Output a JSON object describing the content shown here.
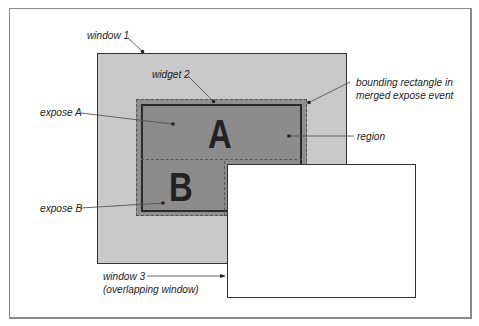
{
  "diagram": {
    "type": "expose-event-region-diagram",
    "shapes": {
      "window1": {
        "label": "window 1",
        "fill": "#c9c9c9"
      },
      "widget2": {
        "label": "widget 2",
        "fill": "#8c8c8c"
      },
      "bounding_rectangle": {
        "label": "bounding rectangle in merged expose event",
        "style": "dashed"
      },
      "window3": {
        "label": "window 3 (overlapping window)",
        "fill": "#ffffff"
      }
    },
    "big_letters": {
      "a": "A",
      "b": "B"
    },
    "labels": {
      "window1": "window 1",
      "widget2": "widget 2",
      "expose_a": "expose A",
      "expose_b": "expose B",
      "bounding_line1": "bounding rectangle in",
      "bounding_line2": "merged expose event",
      "region": "region",
      "window3_line1": "window 3",
      "window3_line2": "(overlapping window)"
    }
  }
}
